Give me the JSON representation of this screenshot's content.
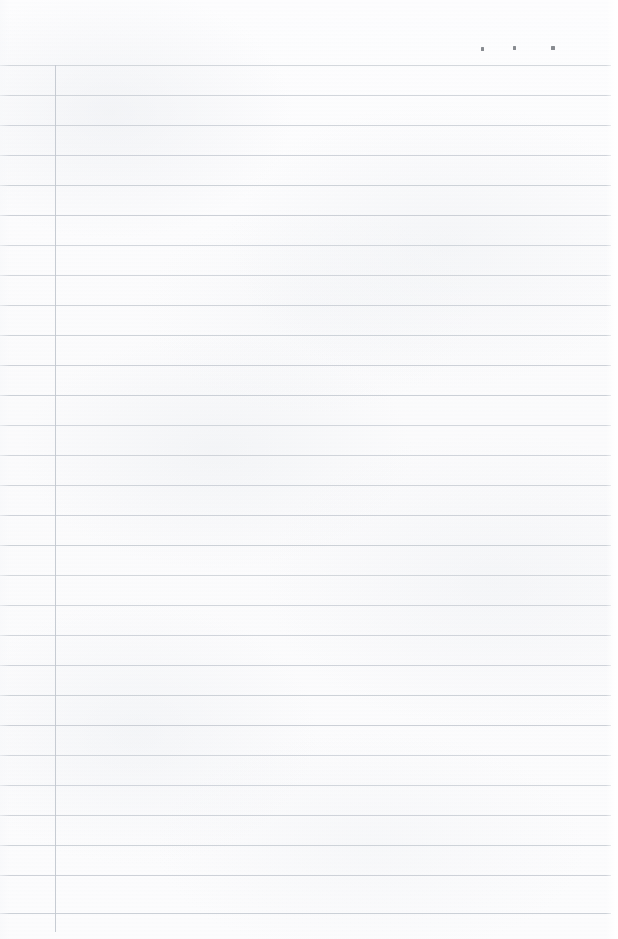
{
  "document": {
    "kind": "scanned-ruled-notebook-page",
    "page_width": 618,
    "page_height": 939,
    "paper_color": "#fcfcfd",
    "rule_color": "#c9ced5",
    "margin_line_color": "#c4c9d1",
    "speck_color": "#6e7178",
    "body_text": "",
    "header_text": ""
  },
  "ruling": {
    "line_count": 29,
    "first_line_y": 65,
    "line_spacing": 30,
    "line_start_x": 0,
    "line_end_x": 611,
    "margin_line_x": 55,
    "margin_line_top_y": 65,
    "margin_line_bottom_y": 932,
    "lines_y": [
      65,
      95,
      125,
      155,
      185,
      215,
      245,
      275,
      305,
      335,
      365,
      395,
      425,
      455,
      485,
      515,
      545,
      575,
      605,
      635,
      665,
      695,
      725,
      755,
      785,
      815,
      845,
      875,
      913
    ]
  },
  "marks": {
    "specks": [
      {
        "name": "speck-left",
        "x": 481,
        "y": 47,
        "w": 3,
        "h": 4
      },
      {
        "name": "speck-middle",
        "x": 513,
        "y": 46,
        "w": 3,
        "h": 4
      },
      {
        "name": "speck-right",
        "x": 551,
        "y": 46,
        "w": 4,
        "h": 4
      }
    ]
  }
}
